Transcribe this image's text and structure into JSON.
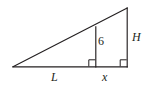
{
  "figure": {
    "kind": "geometry-diagram",
    "stroke_color": "#231f20",
    "background_color": "#ffffff",
    "labels": {
      "inner_height": "6",
      "outer_height": "H",
      "outer_base_segment": "L",
      "inner_base_segment": "x"
    },
    "vertices": {
      "left_base": [
        13,
        67
      ],
      "right_base": [
        127,
        67
      ],
      "apex": [
        127,
        8
      ],
      "inner_foot": [
        96,
        67
      ],
      "inner_top": [
        96,
        27
      ]
    },
    "segments": [
      {
        "name": "base",
        "from": [
          13,
          67
        ],
        "to": [
          127,
          67
        ]
      },
      {
        "name": "hypotenuse",
        "from": [
          13,
          67
        ],
        "to": [
          127,
          8
        ]
      },
      {
        "name": "outer-height",
        "from": [
          127,
          8
        ],
        "to": [
          127,
          67
        ]
      },
      {
        "name": "inner-height",
        "from": [
          96,
          27
        ],
        "to": [
          96,
          67
        ]
      }
    ],
    "right_angle_marks": [
      {
        "name": "inner-right-angle",
        "at": [
          96,
          67
        ],
        "size": 7
      },
      {
        "name": "outer-right-angle",
        "at": [
          127,
          67
        ],
        "size": 7
      }
    ]
  }
}
